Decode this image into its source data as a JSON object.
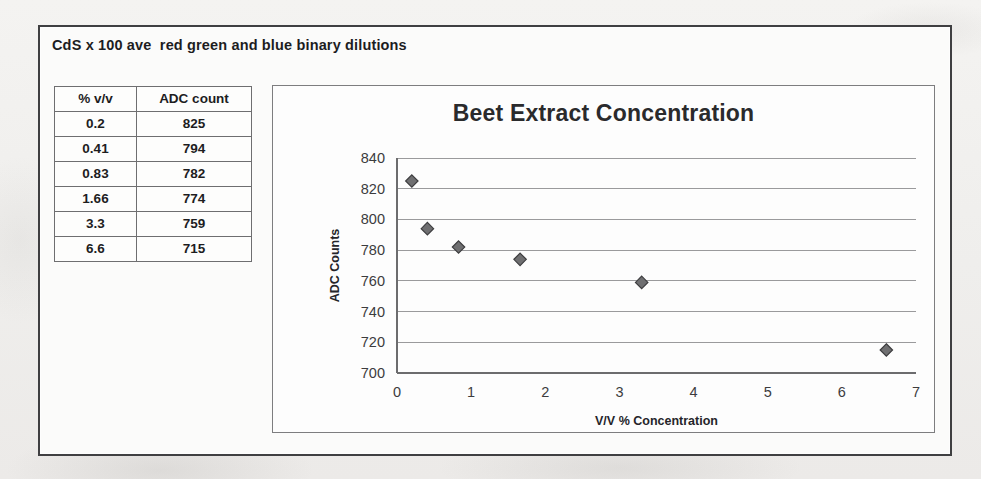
{
  "document": {
    "title": "CdS x 100 ave  red green and blue binary dilutions"
  },
  "table": {
    "headers": [
      "% v/v",
      "ADC count"
    ],
    "rows": [
      [
        "0.2",
        "825"
      ],
      [
        "0.41",
        "794"
      ],
      [
        "0.83",
        "782"
      ],
      [
        "1.66",
        "774"
      ],
      [
        "3.3",
        "759"
      ],
      [
        "6.6",
        "715"
      ]
    ]
  },
  "chart_data": {
    "type": "scatter",
    "title": "Beet Extract Concentration",
    "xlabel": "V/V % Concentration",
    "ylabel": "ADC Counts",
    "x": [
      0.2,
      0.41,
      0.83,
      1.66,
      3.3,
      6.6
    ],
    "values": [
      825,
      794,
      782,
      774,
      759,
      715
    ],
    "xlim": [
      0,
      7
    ],
    "ylim": [
      700,
      840
    ],
    "xticks": [
      "0",
      "1",
      "2",
      "3",
      "4",
      "5",
      "6",
      "7"
    ],
    "yticks": [
      "700",
      "720",
      "740",
      "760",
      "780",
      "800",
      "820",
      "840"
    ],
    "grid": "horizontal",
    "legend": "none",
    "marker": "diamond",
    "marker_color": "#6f6f71",
    "marker_edge_color": "#3d3d3f"
  }
}
